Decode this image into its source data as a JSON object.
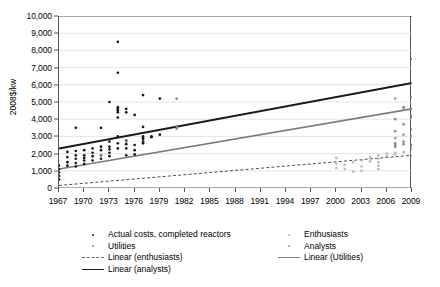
{
  "chart_data": {
    "type": "scatter",
    "title": "",
    "xlabel": "",
    "ylabel": "2008$/kw",
    "xlim": [
      1967,
      2009
    ],
    "ylim": [
      0,
      10000
    ],
    "grid": true,
    "legend_position": "bottom",
    "x_ticks": [
      1967,
      1970,
      1973,
      1976,
      1979,
      1982,
      1985,
      1988,
      1991,
      1994,
      1997,
      2000,
      2003,
      2006,
      2009
    ],
    "y_ticks": [
      "0",
      "1,000",
      "2,000",
      "3,000",
      "4,000",
      "5,000",
      "6,000",
      "7,000",
      "8,000",
      "9,000",
      "10,000"
    ],
    "y_tick_values": [
      0,
      1000,
      2000,
      3000,
      4000,
      5000,
      6000,
      7000,
      8000,
      9000,
      10000
    ],
    "series": [
      {
        "name": "Actual costs, completed reactors",
        "marker": "dot",
        "color": "#1a1a1a",
        "points": [
          [
            1967,
            1100
          ],
          [
            1967,
            900
          ],
          [
            1967,
            700
          ],
          [
            1967,
            1300
          ],
          [
            1967,
            500
          ],
          [
            1968,
            1500
          ],
          [
            1968,
            1800
          ],
          [
            1968,
            2100
          ],
          [
            1968,
            1300
          ],
          [
            1969,
            3500
          ],
          [
            1969,
            1700
          ],
          [
            1969,
            1450
          ],
          [
            1969,
            1250
          ],
          [
            1969,
            1900
          ],
          [
            1969,
            2150
          ],
          [
            1970,
            1600
          ],
          [
            1970,
            1900
          ],
          [
            1970,
            2200
          ],
          [
            1970,
            1400
          ],
          [
            1970,
            1750
          ],
          [
            1971,
            1850
          ],
          [
            1971,
            2050
          ],
          [
            1971,
            1600
          ],
          [
            1971,
            2300
          ],
          [
            1972,
            3500
          ],
          [
            1972,
            1900
          ],
          [
            1972,
            2200
          ],
          [
            1972,
            1700
          ],
          [
            1972,
            2400
          ],
          [
            1973,
            5000
          ],
          [
            1973,
            2700
          ],
          [
            1973,
            2400
          ],
          [
            1973,
            2050
          ],
          [
            1973,
            1850
          ],
          [
            1973,
            2250
          ],
          [
            1974,
            8500
          ],
          [
            1974,
            6700
          ],
          [
            1974,
            4700
          ],
          [
            1974,
            4600
          ],
          [
            1974,
            4500
          ],
          [
            1974,
            4400
          ],
          [
            1974,
            4100
          ],
          [
            1974,
            2600
          ],
          [
            1974,
            2300
          ],
          [
            1974,
            3000
          ],
          [
            1975,
            4600
          ],
          [
            1975,
            4400
          ],
          [
            1975,
            2750
          ],
          [
            1975,
            2300
          ],
          [
            1975,
            1900
          ],
          [
            1975,
            2550
          ],
          [
            1976,
            4250
          ],
          [
            1976,
            2500
          ],
          [
            1976,
            2200
          ],
          [
            1976,
            1950
          ],
          [
            1977,
            5400
          ],
          [
            1977,
            3550
          ],
          [
            1977,
            2850
          ],
          [
            1977,
            2700
          ],
          [
            1977,
            2600
          ],
          [
            1977,
            2900
          ],
          [
            1977,
            3000
          ],
          [
            1978,
            3000
          ],
          [
            1978,
            2950
          ],
          [
            1979,
            5200
          ],
          [
            1979,
            3100
          ]
        ]
      },
      {
        "name": "Utilities",
        "marker": "dot",
        "color": "#8a8a8a",
        "points": [
          [
            1972,
            1900
          ],
          [
            1975,
            2700
          ],
          [
            1981,
            5200
          ],
          [
            1981,
            3600
          ],
          [
            1981,
            3450
          ],
          [
            2007,
            4000
          ],
          [
            2007,
            3300
          ],
          [
            2007,
            2600
          ],
          [
            2007,
            2500
          ],
          [
            2007,
            2400
          ],
          [
            2008,
            4700
          ],
          [
            2008,
            3700
          ],
          [
            2008,
            2700
          ],
          [
            2008,
            2550
          ],
          [
            2009,
            7500
          ],
          [
            2009,
            6100
          ],
          [
            2009,
            4600
          ],
          [
            2009,
            4100
          ],
          [
            2009,
            3400
          ],
          [
            2009,
            2500
          ]
        ]
      },
      {
        "name": "Enthusiasts",
        "marker": "dot",
        "color": "#bdbdbd",
        "points": [
          [
            2000,
            1750
          ],
          [
            2000,
            1400
          ],
          [
            2000,
            1150
          ],
          [
            2001,
            1350
          ],
          [
            2001,
            1100
          ],
          [
            2002,
            1500
          ],
          [
            2002,
            950
          ],
          [
            2003,
            1600
          ],
          [
            2003,
            1250
          ],
          [
            2003,
            1000
          ],
          [
            2004,
            1800
          ],
          [
            2004,
            1550
          ],
          [
            2005,
            1900
          ],
          [
            2005,
            1700
          ],
          [
            2005,
            1500
          ],
          [
            2005,
            1300
          ],
          [
            2005,
            1100
          ],
          [
            2006,
            2000
          ],
          [
            2006,
            1850
          ],
          [
            2007,
            2050
          ],
          [
            2007,
            1950
          ],
          [
            2008,
            2100
          ]
        ]
      },
      {
        "name": "Analysts",
        "marker": "dot",
        "color": "#9e9e9e",
        "points": [
          [
            2007,
            5200
          ],
          [
            2007,
            2900
          ],
          [
            2008,
            4600
          ],
          [
            2008,
            3100
          ],
          [
            2009,
            5300
          ],
          [
            2009,
            4200
          ],
          [
            2009,
            3000
          ],
          [
            2009,
            2300
          ]
        ]
      }
    ],
    "trendlines": [
      {
        "name": "Linear (enthusiasts)",
        "style": "dashed",
        "color": "#4d4d4d",
        "width": 1,
        "x0": 1967,
        "y0": 150,
        "x1": 2009,
        "y1": 1900
      },
      {
        "name": "Linear (Utilities)",
        "style": "solid",
        "color": "#7a7a7a",
        "width": 1.6,
        "x0": 1967,
        "y0": 1100,
        "x1": 2009,
        "y1": 4600
      },
      {
        "name": "Linear (analysts)",
        "style": "solid",
        "color": "#1a1a1a",
        "width": 2.0,
        "x0": 1967,
        "y0": 2300,
        "x1": 2009,
        "y1": 6100
      }
    ]
  },
  "legend": {
    "items": [
      {
        "label": "Actual costs, completed reactors",
        "mark": "dot",
        "color": "#1a1a1a",
        "row": 0,
        "col": 0
      },
      {
        "label": "Enthusiasts",
        "mark": "dot",
        "color": "#bdbdbd",
        "row": 0,
        "col": 1
      },
      {
        "label": "Utilities",
        "mark": "dot",
        "color": "#8a8a8a",
        "row": 1,
        "col": 0
      },
      {
        "label": "Analysts",
        "mark": "dot",
        "color": "#9e9e9e",
        "row": 1,
        "col": 1
      },
      {
        "label": "Linear (enthusiasts)",
        "mark": "dashed",
        "color": "#6b6b6b",
        "row": 2,
        "col": 0
      },
      {
        "label": "Linear (Utilities)",
        "mark": "line",
        "color": "#7a7a7a",
        "row": 2,
        "col": 1
      },
      {
        "label": "Linear (analysts)",
        "mark": "line",
        "color": "#1a1a1a",
        "row": 3,
        "col": 0
      }
    ]
  },
  "colors": {
    "axis": "#555555",
    "grid": "#d9d9d9",
    "text": "#000000",
    "background": "#ffffff"
  }
}
